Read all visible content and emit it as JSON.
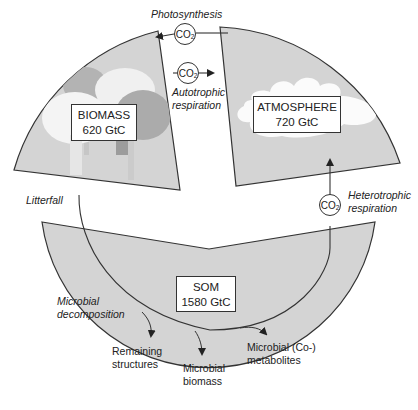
{
  "pools": {
    "biomass": {
      "name": "BIOMASS",
      "value": "620 GtC"
    },
    "atmosphere": {
      "name": "ATMOSPHERE",
      "value": "720 GtC"
    },
    "som": {
      "name": "SOM",
      "value": "1580 GtC"
    }
  },
  "fluxes": {
    "photosynthesis": "Photosynthesis",
    "autotrophic_line1": "Autotrophic",
    "autotrophic_line2": "respiration",
    "heterotrophic_line1": "Heterotrophic",
    "heterotrophic_line2": "respiration",
    "litterfall": "Litterfall",
    "microbial_decomp_line1": "Microbial",
    "microbial_decomp_line2": "decomposition"
  },
  "gas": {
    "co2_base": "CO",
    "co2_sub": "2"
  },
  "products": {
    "remaining_line1": "Remaining",
    "remaining_line2": "structures",
    "microbial_biomass_line1": "Microbial",
    "microbial_biomass_line2": "biomass",
    "metabolites_line1": "Microbial (Co-)",
    "metabolites_line2": "metabolites"
  },
  "colors": {
    "sector_fill": "#d4d4d4",
    "tree_dark": "#a9a9a9",
    "tree_light": "#f4f4f4",
    "stroke": "#333333"
  }
}
